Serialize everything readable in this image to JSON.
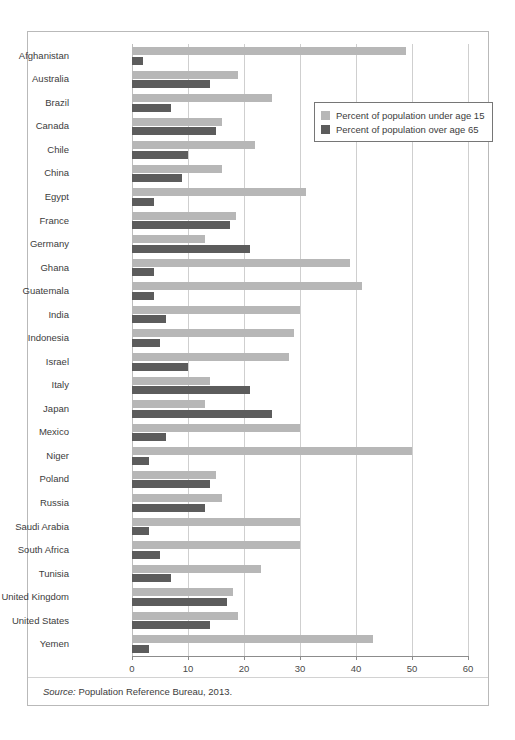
{
  "figure": {
    "source_label": "Source:",
    "source_text": " Population Reference Bureau, 2013."
  },
  "legend": {
    "position": "top-right-inside",
    "items": [
      {
        "label": "Percent of population under age 15",
        "color": "#b7b7b7",
        "key": "under15"
      },
      {
        "label": "Percent of population over age 65",
        "color": "#5c5c5c",
        "key": "over65"
      }
    ]
  },
  "axis": {
    "ticks": [
      "0",
      "10",
      "20",
      "30",
      "40",
      "50",
      "60"
    ],
    "min": 0,
    "max": 60,
    "step": 10
  },
  "chart_data": {
    "type": "bar",
    "orientation": "horizontal",
    "title": "",
    "subtitle": "",
    "xlabel": "",
    "ylabel": "",
    "xlim": [
      0,
      60
    ],
    "grid": true,
    "legend_position": "top-right",
    "categories": [
      "Afghanistan",
      "Australia",
      "Brazil",
      "Canada",
      "Chile",
      "China",
      "Egypt",
      "France",
      "Germany",
      "Ghana",
      "Guatemala",
      "India",
      "Indonesia",
      "Israel",
      "Italy",
      "Japan",
      "Mexico",
      "Niger",
      "Poland",
      "Russia",
      "Saudi Arabia",
      "South Africa",
      "Tunisia",
      "United Kingdom",
      "United States",
      "Yemen"
    ],
    "series": [
      {
        "name": "Percent of population under age 15",
        "color": "#b7b7b7",
        "values": [
          49,
          19,
          25,
          16,
          22,
          16,
          31,
          18.5,
          13,
          39,
          41,
          30,
          29,
          28,
          14,
          13,
          30,
          50,
          15,
          16,
          30,
          30,
          23,
          18,
          19,
          43
        ]
      },
      {
        "name": "Percent of population over age 65",
        "color": "#5c5c5c",
        "values": [
          2,
          14,
          7,
          15,
          10,
          9,
          4,
          17.5,
          21,
          4,
          4,
          6,
          5,
          10,
          21,
          25,
          6,
          3,
          14,
          13,
          3,
          5,
          7,
          17,
          14,
          3
        ]
      }
    ]
  }
}
